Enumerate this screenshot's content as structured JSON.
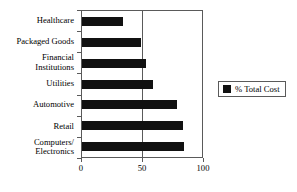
{
  "chart_data": {
    "type": "bar",
    "orientation": "horizontal",
    "title": "",
    "subtitle": "",
    "xlabel": "",
    "ylabel": "",
    "categories": [
      "Healthcare",
      "Packaged Goods",
      "Financial\nInstitutions",
      "Utilities",
      "Automotive",
      "Retail",
      "Computers/\nElectronics"
    ],
    "series": [
      {
        "name": "% Total Cost",
        "color": "#111111",
        "values": [
          34,
          49,
          53,
          59,
          79,
          84,
          85
        ]
      }
    ],
    "xlim": [
      0,
      100
    ],
    "xticks": [
      0,
      50,
      100
    ],
    "xtick_labels": [
      "0",
      "50",
      "100"
    ],
    "grid": "vertical-at-50",
    "legend": {
      "position": "right",
      "entries": [
        {
          "label": "% Total Cost",
          "swatch_name": "legend-swatch-total-cost",
          "color": "#111111"
        }
      ]
    },
    "frame_color": "#5a5a5a",
    "background": "#ffffff"
  }
}
